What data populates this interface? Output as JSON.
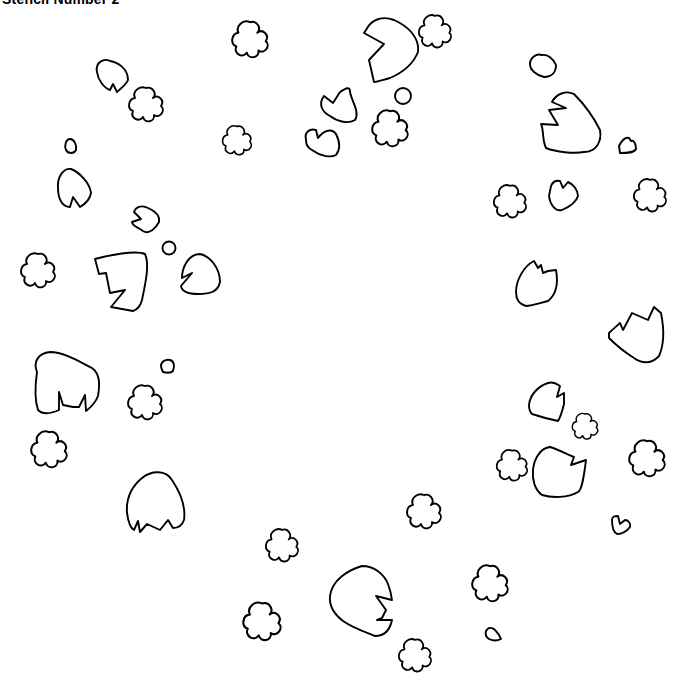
{
  "page": {
    "title": "Stencil Number 2",
    "background_color": "#ffffff",
    "stroke_color": "#000000"
  },
  "shapes": [
    {
      "kind": "leaf",
      "cx": 112,
      "cy": 74
    },
    {
      "kind": "flower",
      "cx": 146,
      "cy": 104
    },
    {
      "kind": "flower",
      "cx": 250,
      "cy": 39
    },
    {
      "kind": "leaf",
      "cx": 389,
      "cy": 49
    },
    {
      "kind": "flower",
      "cx": 435,
      "cy": 31
    },
    {
      "kind": "circle",
      "cx": 403,
      "cy": 96
    },
    {
      "kind": "leaf",
      "cx": 340,
      "cy": 104
    },
    {
      "kind": "flower",
      "cx": 390,
      "cy": 128
    },
    {
      "kind": "leaf",
      "cx": 322,
      "cy": 142
    },
    {
      "kind": "flower",
      "cx": 237,
      "cy": 140
    },
    {
      "kind": "blob",
      "cx": 543,
      "cy": 66
    },
    {
      "kind": "leaf",
      "cx": 569,
      "cy": 124
    },
    {
      "kind": "blob",
      "cx": 627,
      "cy": 145
    },
    {
      "kind": "flower",
      "cx": 510,
      "cy": 201
    },
    {
      "kind": "leaf",
      "cx": 564,
      "cy": 196
    },
    {
      "kind": "flower",
      "cx": 650,
      "cy": 195
    },
    {
      "kind": "blob",
      "cx": 70,
      "cy": 145
    },
    {
      "kind": "leaf",
      "cx": 73,
      "cy": 188
    },
    {
      "kind": "leaf",
      "cx": 145,
      "cy": 219
    },
    {
      "kind": "circle",
      "cx": 169,
      "cy": 248
    },
    {
      "kind": "flower",
      "cx": 38,
      "cy": 270
    },
    {
      "kind": "leaf",
      "cx": 120,
      "cy": 280
    },
    {
      "kind": "leaf",
      "cx": 200,
      "cy": 275
    },
    {
      "kind": "leaf",
      "cx": 538,
      "cy": 283
    },
    {
      "kind": "leaf",
      "cx": 636,
      "cy": 336
    },
    {
      "kind": "leaf",
      "cx": 66,
      "cy": 383
    },
    {
      "kind": "blob",
      "cx": 166,
      "cy": 367
    },
    {
      "kind": "flower",
      "cx": 145,
      "cy": 402
    },
    {
      "kind": "flower",
      "cx": 49,
      "cy": 449
    },
    {
      "kind": "leaf",
      "cx": 548,
      "cy": 400
    },
    {
      "kind": "flower",
      "cx": 585,
      "cy": 426
    },
    {
      "kind": "flower",
      "cx": 512,
      "cy": 465
    },
    {
      "kind": "leaf",
      "cx": 557,
      "cy": 465
    },
    {
      "kind": "flower",
      "cx": 647,
      "cy": 458
    },
    {
      "kind": "leaf",
      "cx": 156,
      "cy": 502
    },
    {
      "kind": "flower",
      "cx": 424,
      "cy": 511
    },
    {
      "kind": "leaf",
      "cx": 621,
      "cy": 524
    },
    {
      "kind": "flower",
      "cx": 282,
      "cy": 545
    },
    {
      "kind": "leaf",
      "cx": 360,
      "cy": 601
    },
    {
      "kind": "flower",
      "cx": 490,
      "cy": 583
    },
    {
      "kind": "flower",
      "cx": 262,
      "cy": 621
    },
    {
      "kind": "blob",
      "cx": 493,
      "cy": 635
    },
    {
      "kind": "flower",
      "cx": 415,
      "cy": 655
    }
  ]
}
